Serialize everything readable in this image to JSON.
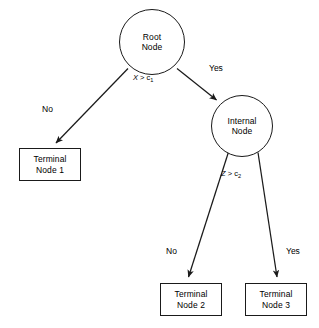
{
  "diagram": {
    "type": "decision-tree",
    "nodes": [
      {
        "id": "root",
        "shape": "circle",
        "line1": "Root",
        "line2": "Node"
      },
      {
        "id": "internal",
        "shape": "circle",
        "line1": "Internal",
        "line2": "Node"
      },
      {
        "id": "terminal1",
        "shape": "box",
        "line1": "Terminal",
        "line2": "Node 1"
      },
      {
        "id": "terminal2",
        "shape": "box",
        "line1": "Terminal",
        "line2": "Node 2"
      },
      {
        "id": "terminal3",
        "shape": "box",
        "line1": "Terminal",
        "line2": "Node 3"
      }
    ],
    "conditions": [
      {
        "id": "root-condition",
        "variable": "X",
        "operator": ">",
        "threshold": "c",
        "subscript": "1"
      },
      {
        "id": "internal-condition",
        "variable": "Z",
        "operator": ">",
        "threshold": "c",
        "subscript": "2"
      }
    ],
    "edges": [
      {
        "id": "root-to-terminal1",
        "from": "root",
        "to": "terminal1",
        "label": "No"
      },
      {
        "id": "root-to-internal",
        "from": "root",
        "to": "internal",
        "label": "Yes"
      },
      {
        "id": "internal-to-terminal2",
        "from": "internal",
        "to": "terminal2",
        "label": "No"
      },
      {
        "id": "internal-to-terminal3",
        "from": "internal",
        "to": "terminal3",
        "label": "Yes"
      }
    ],
    "colors": {
      "stroke": "#1a1a1a",
      "background": "#ffffff",
      "text": "#000000"
    }
  }
}
